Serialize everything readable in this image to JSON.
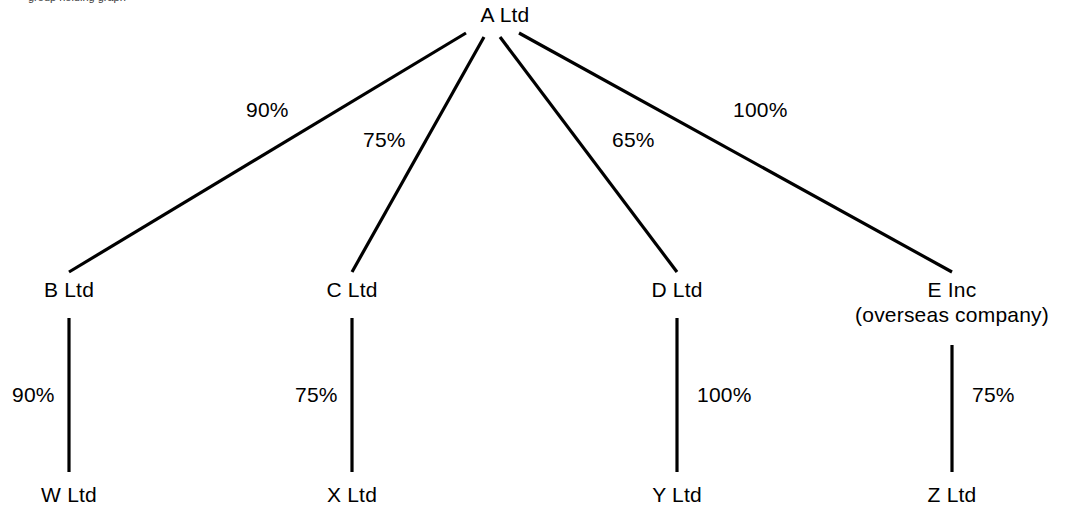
{
  "diagram": {
    "title_clipped": "group holding graph",
    "type": "corporate-group-structure-tree",
    "nodes": {
      "root": {
        "label": "A Ltd"
      },
      "level1": [
        {
          "id": "b",
          "label": "B Ltd",
          "sub": ""
        },
        {
          "id": "c",
          "label": "C Ltd",
          "sub": ""
        },
        {
          "id": "d",
          "label": "D Ltd",
          "sub": ""
        },
        {
          "id": "e",
          "label": "E Inc",
          "sub": "(overseas company)"
        }
      ],
      "level2": [
        {
          "id": "w",
          "label": "W Ltd"
        },
        {
          "id": "x",
          "label": "X Ltd"
        },
        {
          "id": "y",
          "label": "Y Ltd"
        },
        {
          "id": "z",
          "label": "Z Ltd"
        }
      ]
    },
    "edges": {
      "root_to_level1": [
        {
          "from": "A Ltd",
          "to": "B Ltd",
          "label": "90%"
        },
        {
          "from": "A Ltd",
          "to": "C Ltd",
          "label": "75%"
        },
        {
          "from": "A Ltd",
          "to": "D Ltd",
          "label": "65%"
        },
        {
          "from": "A Ltd",
          "to": "E Inc",
          "label": "100%"
        }
      ],
      "level1_to_level2": [
        {
          "from": "B Ltd",
          "to": "W Ltd",
          "label": "90%"
        },
        {
          "from": "C Ltd",
          "to": "X Ltd",
          "label": "75%"
        },
        {
          "from": "D Ltd",
          "to": "Y Ltd",
          "label": "100%"
        },
        {
          "from": "E Inc",
          "to": "Z Ltd",
          "label": "75%"
        }
      ]
    },
    "colors": {
      "line": "#000000",
      "text": "#000000",
      "background": "#ffffff"
    }
  }
}
